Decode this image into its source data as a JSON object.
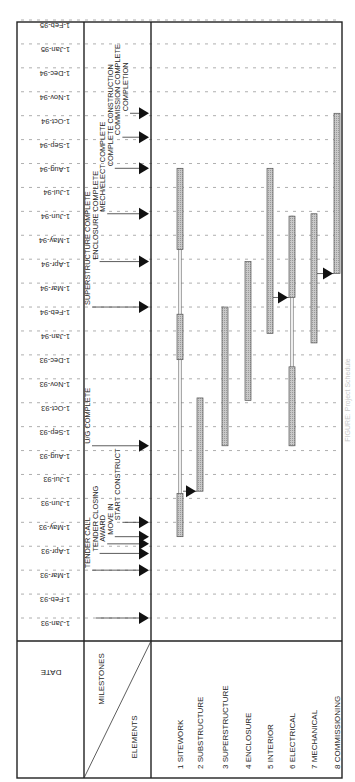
{
  "chart_data": {
    "type": "gantt",
    "title": "",
    "orientation": "rotated-90",
    "header": {
      "date_label": "DATE",
      "milestones_label": "MILESTONES",
      "elements_label": "ELEMENTS"
    },
    "months": [
      "1-Jan-93",
      "1-Feb-93",
      "1-Mar-93",
      "1-Apr-93",
      "1-May-93",
      "1-Jun-93",
      "1-Jul-93",
      "1-Aug-93",
      "1-Sep-93",
      "1-Oct-93",
      "1-Nov-93",
      "1-Dec-93",
      "1-Jan-94",
      "1-Feb-94",
      "1-Mar-94",
      "1-Apr-94",
      "1-May-94",
      "1-Jun-94",
      "1-Jul-94",
      "1-Aug-94",
      "1-Sep-94",
      "1-Oct-94",
      "1-Nov-94",
      "1-Dec-94",
      "1-Jan-95",
      "1-Feb-95"
    ],
    "elements": [
      {
        "label": "1 SITEWORK",
        "bars": [
          [
            3.4,
            5.2
          ],
          [
            10.8,
            12.7
          ],
          [
            15.4,
            18.8
          ]
        ]
      },
      {
        "label": "2 SUBSTRUCTURE",
        "bars": [
          [
            5.3,
            9.2
          ]
        ]
      },
      {
        "label": "3 SUPERSTRUCTURE",
        "bars": [
          [
            7.2,
            13.0
          ]
        ]
      },
      {
        "label": "4 ENCLOSURE",
        "bars": [
          [
            9.1,
            14.9
          ]
        ]
      },
      {
        "label": "5 INTERIOR",
        "bars": [
          [
            11.9,
            18.8
          ]
        ]
      },
      {
        "label": "6 ELECTRICAL",
        "bars": [
          [
            7.2,
            10.5
          ],
          [
            13.4,
            16.8
          ]
        ]
      },
      {
        "label": "7 MECHANICAL",
        "bars": [
          [
            11.5,
            16.9
          ]
        ]
      },
      {
        "label": "8 COMMISSIONING",
        "bars": [
          [
            14.4,
            21.1
          ]
        ]
      }
    ],
    "links": [
      {
        "from": 0,
        "to": 1,
        "at": 5.3
      },
      {
        "from": 4,
        "to": 5,
        "at": 13.4
      },
      {
        "from": 6,
        "to": 7,
        "at": 14.4
      }
    ],
    "milestones": [
      {
        "label": "TENDER CALL",
        "month": 2.0,
        "offset": 0
      },
      {
        "label": "TENDER CLOSING",
        "month": 2.7,
        "offset": 1
      },
      {
        "label": "AWARD",
        "month": 3.1,
        "offset": 2
      },
      {
        "label": "MOVE IN",
        "month": 3.4,
        "offset": 3
      },
      {
        "label": "START CONSTRUCT",
        "month": 4.0,
        "offset": 4
      },
      {
        "label": "U/G COMPLETE",
        "month": 7.2,
        "offset": 0
      },
      {
        "label": "SUPERSTRUCTURE COMPLETE",
        "month": 13.0,
        "offset": 0
      },
      {
        "label": "ENCLOSURE COMPLETE",
        "month": 14.9,
        "offset": 1
      },
      {
        "label": "MECH/ELECT COMPLETE",
        "month": 16.9,
        "offset": 2
      },
      {
        "label": "COMPLETE CONSTRUCTION",
        "month": 18.8,
        "offset": 3
      },
      {
        "label": "COMMISSION COMPLETE",
        "month": 20.1,
        "offset": 4
      },
      {
        "label": "COMPLETION",
        "month": 21.1,
        "offset": 5
      }
    ],
    "first_milestone_arrow": {
      "month": 0.0
    }
  },
  "caption": {
    "text": "FIGURE: Project Schedule"
  }
}
